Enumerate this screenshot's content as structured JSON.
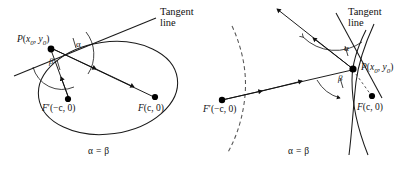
{
  "figure": {
    "background_color": "#ffffff",
    "stroke_color": "#111111",
    "dashed_color": "#555555",
    "width": 411,
    "height": 169
  },
  "panels": [
    {
      "id": "ellipse-panel",
      "conic": "ellipse",
      "tangent_label_line1": "Tangent",
      "tangent_label_line2": "line",
      "point_p": {
        "base": "P",
        "open": "(",
        "x_var": "x",
        "x_sub": "0",
        "comma": ", ",
        "y_var": "y",
        "y_sub": "0",
        "close": ")"
      },
      "focus_left": {
        "base": "F",
        "prime": "′",
        "coords": "(−c, 0)"
      },
      "focus_right": {
        "base": "F",
        "coords": "(c, 0)"
      },
      "angle_alpha": "α",
      "angle_beta": "β",
      "caption": "α = β"
    },
    {
      "id": "hyperbola-panel",
      "conic": "hyperbola",
      "tangent_label_line1": "Tangent",
      "tangent_label_line2": "line",
      "point_p": {
        "base": "P",
        "open": "(",
        "x_var": "x",
        "x_sub": "0",
        "comma": ", ",
        "y_var": "y",
        "y_sub": "0",
        "close": ")"
      },
      "focus_left": {
        "base": "F",
        "prime": "′",
        "coords": "(−c, 0)"
      },
      "focus_right": {
        "base": "F",
        "coords": "(c, 0)"
      },
      "angle_alpha": "α",
      "angle_beta": "β",
      "caption": "α = β"
    }
  ]
}
